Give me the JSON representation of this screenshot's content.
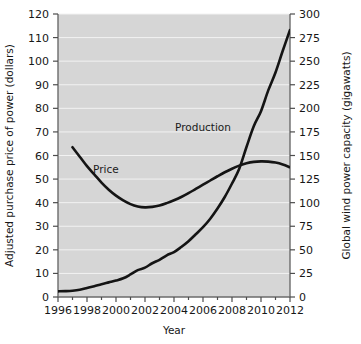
{
  "chart_data": {
    "type": "line",
    "title": "",
    "subtitle": "",
    "xlabel": "Year",
    "ylabel": "Adjusted purchase price of power (dollars)",
    "y2label": "Global wind power capacity (gigawatts)",
    "xlim": [
      1996,
      2012
    ],
    "ylim": [
      0,
      120
    ],
    "y2lim": [
      0,
      300
    ],
    "grid": true,
    "legend_position": "inline-annotations",
    "xticks": [
      1996,
      1998,
      2000,
      2002,
      2004,
      2006,
      2008,
      2010,
      2012
    ],
    "xtick_labels": [
      "1996",
      "1998",
      "2000",
      "2002",
      "2004",
      "2006",
      "2008",
      "2010",
      "2012"
    ],
    "x_minor_ticks": [
      1997,
      1999,
      2001,
      2003,
      2005,
      2007,
      2009,
      2011
    ],
    "yticks": [
      0,
      10,
      20,
      30,
      40,
      50,
      60,
      70,
      80,
      90,
      100,
      110,
      120
    ],
    "ytick_labels": [
      "0",
      "10",
      "20",
      "30",
      "40",
      "50",
      "60",
      "70",
      "80",
      "90",
      "100",
      "110",
      "120"
    ],
    "y2ticks": [
      0,
      25,
      50,
      75,
      100,
      125,
      150,
      175,
      200,
      225,
      250,
      275,
      300
    ],
    "y2tick_labels": [
      "0",
      "25",
      "50",
      "75",
      "100",
      "125",
      "150",
      "175",
      "200",
      "225",
      "250",
      "275",
      "300"
    ],
    "annotations": [
      {
        "text": "Price",
        "x": 1999.3,
        "y": 52.5,
        "axis": "left"
      },
      {
        "text": "Production",
        "x": 2006.0,
        "y": 176,
        "axis": "right"
      }
    ],
    "series": [
      {
        "name": "Price",
        "label": "Price",
        "axis": "left",
        "units": "dollars",
        "color": "#141414",
        "x": [
          1997.0,
          1997.5,
          1998.0,
          1998.5,
          1999.0,
          1999.5,
          2000.0,
          2000.5,
          2001.0,
          2001.5,
          2002.0,
          2002.5,
          2003.0,
          2003.5,
          2004.0,
          2004.5,
          2005.0,
          2005.5,
          2006.0,
          2006.5,
          2007.0,
          2007.5,
          2008.0,
          2008.5,
          2009.0,
          2009.5,
          2010.0,
          2010.5,
          2011.0,
          2011.5,
          2012.0
        ],
        "y": [
          63.5,
          59.5,
          55.5,
          52.0,
          48.5,
          45.5,
          43.0,
          41.0,
          39.4,
          38.4,
          38.0,
          38.2,
          38.8,
          39.8,
          41.0,
          42.4,
          44.0,
          45.8,
          47.6,
          49.4,
          51.2,
          52.9,
          54.4,
          55.7,
          56.7,
          57.3,
          57.5,
          57.4,
          57.0,
          56.2,
          55.0
        ]
      },
      {
        "name": "Production",
        "label": "Production",
        "axis": "right",
        "units": "gigawatts",
        "color": "#141414",
        "x": [
          1996.0,
          1996.5,
          1997.0,
          1997.5,
          1998.0,
          1998.5,
          1999.0,
          1999.5,
          2000.0,
          2000.5,
          2001.0,
          2001.5,
          2002.0,
          2002.5,
          2003.0,
          2003.5,
          2004.0,
          2004.5,
          2005.0,
          2005.5,
          2006.0,
          2006.5,
          2007.0,
          2007.5,
          2008.0,
          2008.5,
          2009.0,
          2009.5,
          2010.0,
          2010.5,
          2011.0,
          2011.5,
          2012.0
        ],
        "y": [
          6.0,
          6.2,
          6.6,
          7.6,
          9.5,
          11.5,
          13.6,
          15.5,
          17.4,
          19.8,
          23.9,
          28.5,
          31.1,
          35.8,
          39.4,
          44.2,
          47.6,
          53.0,
          59.1,
          66.5,
          74.0,
          83.0,
          93.8,
          106.0,
          120.3,
          136.0,
          159.0,
          181.0,
          197.0,
          219.0,
          238.0,
          261.0,
          283.0
        ]
      }
    ]
  },
  "geometry": {
    "plot_left": 58,
    "plot_right": 290,
    "plot_top": 14,
    "plot_bottom": 297
  },
  "figure": {
    "background_color": "#ffffff",
    "plot_background_color": "#d6d6d6",
    "gridline_color": "#f2f2f2",
    "axis_color": "#6b6b6b",
    "curve_color": "#141414"
  }
}
